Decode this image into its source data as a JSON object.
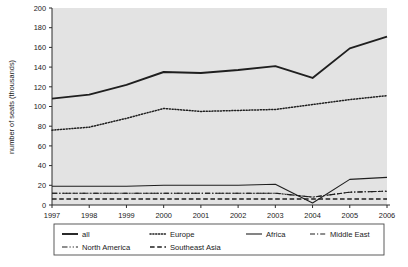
{
  "chart_data": {
    "type": "line",
    "title": "",
    "xlabel": "",
    "ylabel": "number of seats (thousands)",
    "x": [
      1997,
      1998,
      1999,
      2000,
      2001,
      2002,
      2003,
      2004,
      2005,
      2006
    ],
    "xtick_labels": [
      "1997",
      "1998",
      "1999",
      "2000",
      "2001",
      "2002",
      "2003",
      "2004",
      "2005",
      "2006"
    ],
    "ytick_labels": [
      "0",
      "20",
      "40",
      "60",
      "80",
      "100",
      "120",
      "140",
      "160",
      "180",
      "200"
    ],
    "yticks": [
      0,
      20,
      40,
      60,
      80,
      100,
      120,
      140,
      160,
      180,
      200
    ],
    "ylim": [
      0,
      200
    ],
    "grid": false,
    "legend_position": "bottom",
    "plot_background": "#e3e3e3",
    "line_color": "#1f1f1f",
    "series": [
      {
        "name": "all",
        "style": "solid",
        "width": 1.9,
        "values": [
          108,
          112,
          122,
          135,
          134,
          137,
          141,
          129,
          159,
          171
        ]
      },
      {
        "name": "Europe",
        "style": "dotted",
        "width": 1.5,
        "values": [
          76,
          79,
          88,
          98,
          95,
          96,
          97,
          102,
          107,
          111
        ]
      },
      {
        "name": "Africa",
        "style": "solid",
        "width": 1.1,
        "values": [
          19,
          19,
          19,
          20,
          20,
          20,
          21,
          2,
          26,
          28
        ]
      },
      {
        "name": "Middle East",
        "style": "dashdot",
        "width": 1.1,
        "values": [
          12,
          12,
          12,
          12,
          12,
          12,
          12,
          8,
          13,
          14
        ]
      },
      {
        "name": "North America",
        "style": "dashdotdash",
        "width": 1.1,
        "values": [
          12,
          12,
          12,
          12,
          12,
          12,
          12,
          8,
          13,
          14
        ]
      },
      {
        "name": "Southeast Asia",
        "style": "dashed",
        "width": 1.5,
        "values": [
          6,
          6,
          6,
          6,
          6,
          6,
          6,
          6,
          6,
          6
        ]
      }
    ],
    "legend_entries": [
      {
        "label": "all",
        "style": "solid",
        "width": 1.9
      },
      {
        "label": "Europe",
        "style": "dotted",
        "width": 1.5
      },
      {
        "label": "Africa",
        "style": "solid",
        "width": 1.1
      },
      {
        "label": "Middle East",
        "style": "dashdot",
        "width": 1.1
      },
      {
        "label": "North America",
        "style": "dashdotdash",
        "width": 1.1
      },
      {
        "label": "Southeast Asia",
        "style": "dashed",
        "width": 1.5
      }
    ]
  }
}
